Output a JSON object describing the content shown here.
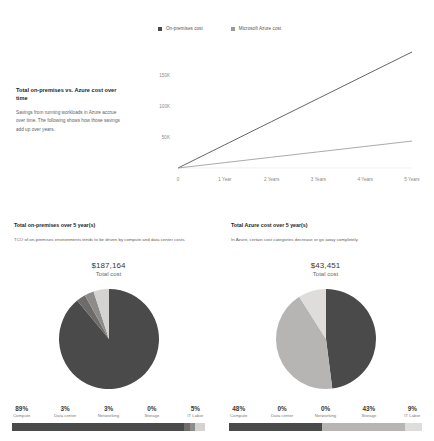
{
  "line_section": {
    "heading": "Total on-premises vs. Azure cost over time",
    "body": "Savings from running workloads in Azure accrue over time. The following shows how those savings add up over years.",
    "legend": [
      {
        "label": "On-premises cost",
        "color": "#4a4a4a"
      },
      {
        "label": "Microsoft Azure cost",
        "color": "#9b9b9b"
      }
    ]
  },
  "chart_data": [
    {
      "type": "line",
      "title": "Total on-premises vs. Azure cost over time",
      "xlabel": "",
      "ylabel": "",
      "x": [
        "0",
        "1 Year",
        "2 Years",
        "3 Years",
        "4 Years",
        "5 Years"
      ],
      "yticks": [
        "50K",
        "100K",
        "150K"
      ],
      "ytick_values": [
        50000,
        100000,
        150000
      ],
      "ylim": [
        0,
        200000
      ],
      "grid": false,
      "legend_position": "top",
      "series": [
        {
          "name": "On-premises cost",
          "color": "#4a4a4a",
          "values": [
            0,
            37433,
            74866,
            112298,
            149731,
            187164
          ]
        },
        {
          "name": "Microsoft Azure cost",
          "color": "#9b9b9b",
          "values": [
            0,
            8690,
            17380,
            26071,
            34761,
            43451
          ]
        }
      ]
    },
    {
      "type": "pie",
      "title": "Total on-premises over 5 year(s)",
      "total_label": "Total cost",
      "total_value": "$187,164",
      "categories": [
        "Compute",
        "Data center",
        "Networking",
        "Storage",
        "IT Labor"
      ],
      "values": [
        89,
        3,
        3,
        0,
        5
      ],
      "value_labels": [
        "89%",
        "3%",
        "3%",
        "0%",
        "5%"
      ],
      "colors": [
        "#4a4a4a",
        "#6d6c6a",
        "#8d8c8a",
        "#b6b5b3",
        "#d4d3d1"
      ]
    },
    {
      "type": "pie",
      "title": "Total Azure cost over 5 year(s)",
      "total_label": "Total cost",
      "total_value": "$43,451",
      "categories": [
        "Compute",
        "Data center",
        "Networking",
        "Storage",
        "IT Labor"
      ],
      "values": [
        48,
        0,
        0,
        43,
        9
      ],
      "value_labels": [
        "48%",
        "0%",
        "0%",
        "43%",
        "9%"
      ],
      "colors": [
        "#4a4a4a",
        "#6d6c6a",
        "#8d8c8a",
        "#b6b5b3",
        "#dedddb"
      ]
    }
  ],
  "left_panel": {
    "title": "Total on-premises over 5 year(s)",
    "subtitle": "TCO of on-premises environments tends to be driven by compute and data center costs.",
    "total_value": "$187,164",
    "total_label": "Total cost",
    "categories": [
      {
        "pct": "89%",
        "name": "Compute",
        "color": "#4a4a4a",
        "share": 89
      },
      {
        "pct": "3%",
        "name": "Data center",
        "color": "#6d6c6a",
        "share": 3
      },
      {
        "pct": "3%",
        "name": "Networking",
        "color": "#8d8c8a",
        "share": 3
      },
      {
        "pct": "0%",
        "name": "Storage",
        "color": "#b6b5b3",
        "share": 0
      },
      {
        "pct": "5%",
        "name": "IT Labor",
        "color": "#d4d3d1",
        "share": 5
      }
    ]
  },
  "right_panel": {
    "title": "Total Azure cost over 5 year(s)",
    "subtitle": "In Azure, certain cost categories decrease or go away completely.",
    "total_value": "$43,451",
    "total_label": "Total cost",
    "categories": [
      {
        "pct": "48%",
        "name": "Compute",
        "color": "#4a4a4a",
        "share": 48
      },
      {
        "pct": "0%",
        "name": "Data center",
        "color": "#6d6c6a",
        "share": 0
      },
      {
        "pct": "0%",
        "name": "Networking",
        "color": "#8d8c8a",
        "share": 0
      },
      {
        "pct": "43%",
        "name": "Storage",
        "color": "#b6b5b3",
        "share": 43
      },
      {
        "pct": "9%",
        "name": "IT Labor",
        "color": "#dedddb",
        "share": 9
      }
    ]
  }
}
